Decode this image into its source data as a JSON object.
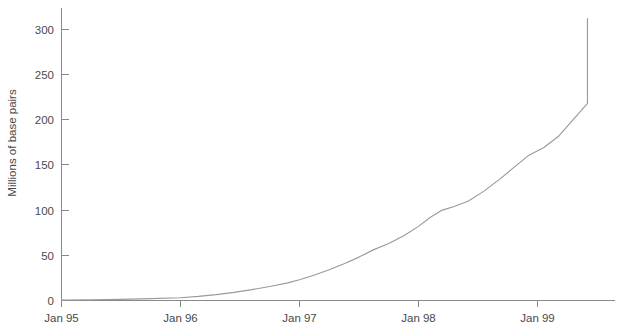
{
  "chart_data": {
    "type": "line",
    "title": "",
    "xlabel": "",
    "ylabel": "Millions of base pairs",
    "ylim": [
      0,
      320
    ],
    "xlim": [
      0,
      4.42
    ],
    "grid": false,
    "legend": null,
    "y_ticks": [
      0,
      50,
      100,
      150,
      200,
      250,
      300
    ],
    "y_tick_labels": [
      "0",
      "50",
      "100",
      "150",
      "200",
      "250",
      "300"
    ],
    "x_ticks": [
      0,
      1,
      2,
      3,
      4
    ],
    "x_tick_labels": [
      "Jan 95",
      "Jan 96",
      "Jan 97",
      "Jan 98",
      "Jan 99"
    ],
    "series": [
      {
        "name": "Cumulative sequenced base pairs",
        "color": "#9a9a9a",
        "x": [
          0.0,
          0.25,
          0.5,
          0.75,
          1.0,
          1.15,
          1.3,
          1.45,
          1.6,
          1.75,
          1.9,
          2.0,
          2.12,
          2.25,
          2.38,
          2.5,
          2.62,
          2.75,
          2.88,
          3.0,
          3.1,
          3.2,
          3.3,
          3.42,
          3.55,
          3.68,
          3.8,
          3.92,
          4.05,
          4.18,
          4.3,
          4.42
        ],
        "y": [
          0.5,
          0.8,
          1.2,
          2.0,
          3.0,
          4.5,
          6.5,
          9.0,
          12.0,
          15.5,
          19.5,
          23.0,
          28.0,
          34.0,
          41.0,
          48.0,
          56.0,
          63.0,
          72.0,
          82.0,
          92.0,
          100.0,
          104.0,
          110.0,
          121.0,
          134.0,
          147.0,
          160.0,
          169.0,
          182.0,
          200.0,
          218.0
        ]
      }
    ],
    "series_tail": {
      "note": "continues linearly to end of plot",
      "x_end": 4.42,
      "y_end": 312
    }
  },
  "axis": {
    "y_axis_label": "Millions of base pairs"
  }
}
